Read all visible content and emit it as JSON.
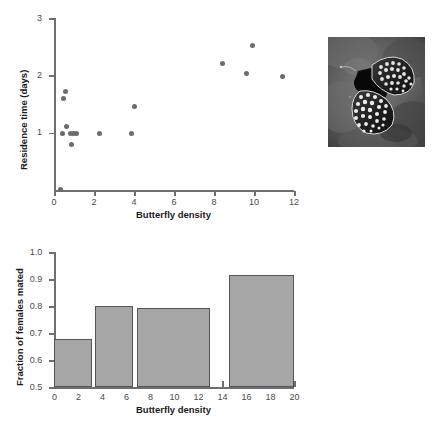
{
  "figure": {
    "panels": [
      "scatter-residence-time",
      "bar-fraction-mated",
      "butterfly-photo"
    ]
  },
  "photo": {
    "name": "butterfly-photograph",
    "alt": "Grayscale photograph of a checkerspot butterfly with spotted wings resting on a rock"
  },
  "chart_data": [
    {
      "type": "scatter",
      "title": "",
      "xlabel": "Butterfly density",
      "ylabel": "Residence time (days)",
      "xlim": [
        0,
        12
      ],
      "ylim": [
        0,
        3
      ],
      "xticks": [
        0,
        2,
        4,
        6,
        8,
        10,
        12
      ],
      "xticklabels": [
        "0",
        "2",
        "4",
        "6",
        "8",
        "10",
        "12"
      ],
      "yticks": [
        0,
        1,
        2,
        3
      ],
      "yticklabels": [
        "",
        "1",
        "2",
        "3"
      ],
      "grid": false,
      "legend": "none",
      "marker": "filled-circle",
      "marker_color": "#6c6c6c",
      "points": [
        {
          "x": 0.3,
          "y": 0.02
        },
        {
          "x": 0.55,
          "y": 1.72
        },
        {
          "x": 0.48,
          "y": 1.6
        },
        {
          "x": 0.62,
          "y": 1.11
        },
        {
          "x": 0.4,
          "y": 1.0
        },
        {
          "x": 0.8,
          "y": 1.0
        },
        {
          "x": 0.95,
          "y": 1.0
        },
        {
          "x": 1.12,
          "y": 1.0
        },
        {
          "x": 0.85,
          "y": 0.8
        },
        {
          "x": 2.25,
          "y": 1.0
        },
        {
          "x": 3.88,
          "y": 1.0
        },
        {
          "x": 4.02,
          "y": 1.46
        },
        {
          "x": 8.4,
          "y": 2.21
        },
        {
          "x": 9.92,
          "y": 2.52
        },
        {
          "x": 9.6,
          "y": 2.03
        },
        {
          "x": 11.4,
          "y": 1.99
        }
      ]
    },
    {
      "type": "bar",
      "title": "",
      "xlabel": "Butterfly density",
      "ylabel": "Fraction of females mated",
      "xlim": [
        0,
        20
      ],
      "ylim": [
        0.5,
        1.0
      ],
      "xticks": [
        0,
        2,
        4,
        6,
        8,
        10,
        12,
        14,
        16,
        18,
        20
      ],
      "xticklabels": [
        "0",
        "2",
        "4",
        "6",
        "8",
        "10",
        "12",
        "14",
        "16",
        "18",
        "20"
      ],
      "yticks": [
        0.5,
        0.6,
        0.7,
        0.8,
        0.9,
        1.0
      ],
      "yticklabels": [
        "0.5",
        "0.6",
        "0.7",
        "0.8",
        "0.9",
        "1.0"
      ],
      "grid": false,
      "legend": "none",
      "bar_color": "#a6a6a6",
      "bar_edge_color": "#555555",
      "bars": [
        {
          "x_start": 0.0,
          "x_end": 3.2,
          "value": 0.68
        },
        {
          "x_start": 3.4,
          "x_end": 6.6,
          "value": 0.8
        },
        {
          "x_start": 6.9,
          "x_end": 13.0,
          "value": 0.795
        },
        {
          "x_start": 14.6,
          "x_end": 20.0,
          "value": 0.915
        }
      ]
    }
  ]
}
